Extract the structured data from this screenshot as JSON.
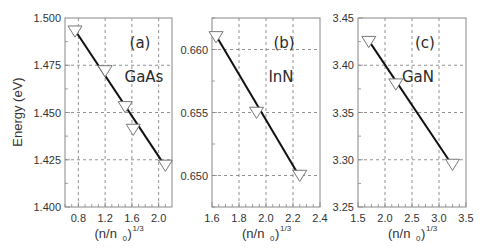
{
  "figure": {
    "ylabel": "Energy (eV)",
    "xlabel_base": "(n/n",
    "xlabel_sub": "0",
    "xlabel_close": ")",
    "xlabel_sup": "1/3"
  },
  "chart_data": [
    {
      "type": "line",
      "panel_label": "(a)",
      "material": "GaAs",
      "title": "",
      "xlabel": "(n/n0)^(1/3)",
      "ylabel": "Energy (eV)",
      "xlim": [
        0.6,
        2.2
      ],
      "ylim": [
        1.4,
        1.5
      ],
      "xticks": [
        0.8,
        1.2,
        1.6,
        2.0
      ],
      "xtick_labels": [
        "0.8",
        "1.2",
        "1.6",
        "2.0"
      ],
      "yticks": [
        1.4,
        1.425,
        1.45,
        1.475,
        1.5
      ],
      "ytick_labels": [
        "1.400",
        "1.425",
        "1.450",
        "1.475",
        "1.500"
      ],
      "grid": true,
      "marker": "downward-triangle-open",
      "x": [
        0.75,
        1.2,
        1.5,
        1.62,
        2.1
      ],
      "y": [
        1.493,
        1.472,
        1.453,
        1.441,
        1.422
      ]
    },
    {
      "type": "line",
      "panel_label": "(b)",
      "material": "InN",
      "title": "",
      "xlabel": "(n/n0)^(1/3)",
      "ylabel": "",
      "xlim": [
        1.6,
        2.4
      ],
      "ylim": [
        0.6475,
        0.6625
      ],
      "xticks": [
        1.6,
        1.8,
        2.0,
        2.2,
        2.4
      ],
      "xtick_labels": [
        "1.6",
        "1.8",
        "2.0",
        "2.2",
        "2.4"
      ],
      "yticks": [
        0.65,
        0.655,
        0.66
      ],
      "ytick_labels": [
        "0.650",
        "0.655",
        "0.660"
      ],
      "grid": true,
      "marker": "downward-triangle-open",
      "x": [
        1.63,
        1.93,
        2.25
      ],
      "y": [
        0.661,
        0.655,
        0.65
      ]
    },
    {
      "type": "line",
      "panel_label": "(c)",
      "material": "GaN",
      "title": "",
      "xlabel": "(n/n0)^(1/3)",
      "ylabel": "",
      "xlim": [
        1.5,
        3.5
      ],
      "ylim": [
        3.25,
        3.45
      ],
      "xticks": [
        1.5,
        2.0,
        2.5,
        3.0,
        3.5
      ],
      "xtick_labels": [
        "1.5",
        "2.0",
        "2.5",
        "3.0",
        "3.5"
      ],
      "yticks": [
        3.25,
        3.3,
        3.35,
        3.4,
        3.45
      ],
      "ytick_labels": [
        "3.25",
        "3.30",
        "3.35",
        "3.40",
        "3.45"
      ],
      "grid": true,
      "marker": "downward-triangle-open",
      "x": [
        1.7,
        2.2,
        3.25
      ],
      "y": [
        3.425,
        3.38,
        3.295
      ]
    }
  ],
  "colors": {
    "axis": "#888888",
    "grid": "#777777",
    "line": "#111111",
    "marker_stroke": "#777777",
    "text": "#333333"
  }
}
